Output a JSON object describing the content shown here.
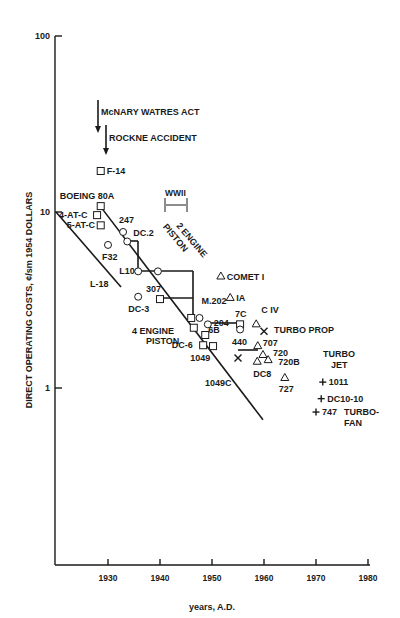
{
  "chart_data": {
    "type": "scatter",
    "title": "",
    "xlabel": "years, A.D.",
    "ylabel": "DIRECT OPERATING COSTS, ¢/sm   1954 DOLLARS",
    "xlim": [
      1920,
      1980
    ],
    "ylim": [
      0.1,
      100
    ],
    "yscale": "log",
    "xticks": [
      1930,
      1940,
      1950,
      1960,
      1970,
      1980
    ],
    "xtick_labels": [
      "1930",
      "1940",
      "1950",
      "1960",
      "1970",
      "1980"
    ],
    "yticks": [
      1,
      10,
      100
    ],
    "ytick_labels": [
      "1",
      "10",
      "100"
    ],
    "grid": false,
    "points": [
      {
        "label": "F-14",
        "year": 1928.6,
        "value": 17.1,
        "marker": "square"
      },
      {
        "label": "BOEING 80A",
        "year": 1928.6,
        "value": 10.8,
        "marker": "square"
      },
      {
        "label": "4-AT-C",
        "year": 1927.9,
        "value": 9.6,
        "marker": "square"
      },
      {
        "label": "5-AT-C",
        "year": 1928.6,
        "value": 8.4,
        "marker": "square"
      },
      {
        "label": "247",
        "year": 1932.9,
        "value": 7.7,
        "marker": "circle"
      },
      {
        "label": "DC.2",
        "year": 1933.7,
        "value": 6.8,
        "marker": "circle"
      },
      {
        "label": "F32",
        "year": 1930.0,
        "value": 6.5,
        "marker": "circle"
      },
      {
        "label": "L10",
        "year": 1935.8,
        "value": 4.6,
        "marker": "circle"
      },
      {
        "label": "L-18",
        "year": 1939.6,
        "value": 4.6,
        "marker": "circle"
      },
      {
        "label": "DC-3",
        "year": 1935.8,
        "value": 3.3,
        "marker": "circle"
      },
      {
        "label": "307",
        "year": 1940.0,
        "value": 3.2,
        "marker": "square"
      },
      {
        "label": "4 ENGINE PISTON",
        "year": 1946.0,
        "value": 2.5,
        "marker": "square"
      },
      {
        "label": "M.202",
        "year": 1947.6,
        "value": 2.5,
        "marker": "circle"
      },
      {
        "label": "DC-6",
        "year": 1946.5,
        "value": 2.2,
        "marker": "square"
      },
      {
        "label": "204",
        "year": 1949.2,
        "value": 2.3,
        "marker": "circle"
      },
      {
        "label": "6B",
        "year": 1948.7,
        "value": 2.0,
        "marker": "square"
      },
      {
        "label": "1049",
        "year": 1948.3,
        "value": 1.75,
        "marker": "square"
      },
      {
        "label": "1049C",
        "year": 1950.2,
        "value": 1.73,
        "marker": "square"
      },
      {
        "label": "7C",
        "year": 1955.4,
        "value": 2.3,
        "marker": "square"
      },
      {
        "label": "440",
        "year": 1955.4,
        "value": 2.15,
        "marker": "circle"
      },
      {
        "label": "COMET I",
        "year": 1951.7,
        "value": 4.3,
        "marker": "triangle"
      },
      {
        "label": "IA",
        "year": 1953.5,
        "value": 3.25,
        "marker": "triangle"
      },
      {
        "label": "C IV",
        "year": 1958.5,
        "value": 2.3,
        "marker": "triangle"
      },
      {
        "label": "TURBO PROP",
        "year": 1960.0,
        "value": 2.1,
        "marker": "x"
      },
      {
        "label": "",
        "year": 1955.0,
        "value": 1.48,
        "marker": "x"
      },
      {
        "label": "707",
        "year": 1958.8,
        "value": 1.73,
        "marker": "triangle"
      },
      {
        "label": "720",
        "year": 1959.8,
        "value": 1.54,
        "marker": "triangle"
      },
      {
        "label": "720B",
        "year": 1960.8,
        "value": 1.44,
        "marker": "triangle"
      },
      {
        "label": "DC8",
        "year": 1958.7,
        "value": 1.41,
        "marker": "triangle"
      },
      {
        "label": "727",
        "year": 1964.0,
        "value": 1.14,
        "marker": "triangle"
      },
      {
        "label": "1011",
        "year": 1971.3,
        "value": 1.08,
        "marker": "plus"
      },
      {
        "label": "DC10-10",
        "year": 1971.0,
        "value": 0.87,
        "marker": "plus"
      },
      {
        "label": "747",
        "year": 1970.0,
        "value": 0.73,
        "marker": "plus"
      }
    ],
    "trend_lines": [
      {
        "name": "lower-bound",
        "from": [
          1920,
          10
        ],
        "to": [
          1932.5,
          3.75
        ]
      },
      {
        "name": "main-trend",
        "from": [
          1928.5,
          10.8
        ],
        "to": [
          1959.8,
          0.66
        ]
      }
    ],
    "annotations": [
      {
        "text": "McNARY WATRES ACT",
        "year": 1930
      },
      {
        "text": "ROCKNE ACCIDENT",
        "year": 1931
      },
      {
        "text": "WWII",
        "range": [
          1939,
          1945
        ]
      },
      {
        "text": "2 ENGINE PISTON"
      },
      {
        "text": "4 ENGINE PISTON"
      },
      {
        "text": "TURBO PROP"
      },
      {
        "text": "TURBO JET"
      },
      {
        "text": "TURBO-FAN"
      }
    ],
    "legend": "none"
  }
}
